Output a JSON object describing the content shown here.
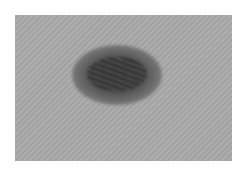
{
  "image": {
    "description": "Grayscale close-up photograph of skin with a dark irregular pigmented lesion near the center",
    "colors": {
      "skin": "#a9a9a9",
      "lesion": "#3a3a3a",
      "border": "#ffffff"
    }
  }
}
